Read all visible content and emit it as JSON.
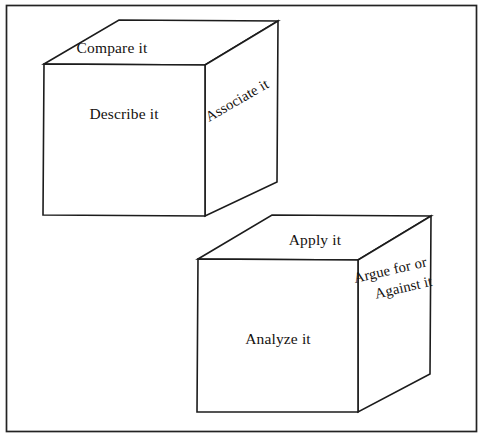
{
  "document": {
    "title": "Cubing Diagram",
    "background_color": "#ffffff",
    "ink_color": "#1c1c1c",
    "frame": {
      "name": "outer-border",
      "x": 6,
      "y": 5,
      "width": 471,
      "height": 427
    }
  },
  "cubes": [
    {
      "id": "cube-upper-left",
      "faces": {
        "top": {
          "label": "Compare it",
          "rotation_deg": 0
        },
        "front": {
          "label": "Describe it",
          "rotation_deg": 0
        },
        "right": {
          "label": "Associate it",
          "rotation_deg": -30
        }
      },
      "geometry": {
        "front_top_left": [
          44,
          64
        ],
        "front_top_right": [
          205,
          65
        ],
        "front_bottom_right": [
          205,
          216
        ],
        "front_bottom_left": [
          43,
          215
        ],
        "back_top_left": [
          119,
          20
        ],
        "back_top_right": [
          278,
          21
        ],
        "back_bottom_right": [
          277,
          182
        ]
      }
    },
    {
      "id": "cube-lower-right",
      "faces": {
        "top": {
          "label": "Apply it",
          "rotation_deg": 0
        },
        "front": {
          "label": "Analyze it",
          "rotation_deg": 0
        },
        "right": {
          "label_line1": "Argue for or",
          "label_line2": "Against it",
          "rotation_deg": -14
        }
      },
      "geometry": {
        "front_top_left": [
          198,
          259
        ],
        "front_top_right": [
          358,
          260
        ],
        "front_bottom_right": [
          358,
          412
        ],
        "front_bottom_left": [
          197,
          412
        ],
        "back_top_left": [
          272,
          215
        ],
        "back_top_right": [
          431,
          216
        ],
        "back_bottom_right": [
          430,
          374
        ]
      }
    }
  ],
  "labels": {
    "compare_it": "Compare it",
    "describe_it": "Describe it",
    "associate_it": "Associate it",
    "apply_it": "Apply it",
    "analyze_it": "Analyze it",
    "argue_for_or": "Argue for or",
    "against_it": "Against it"
  }
}
